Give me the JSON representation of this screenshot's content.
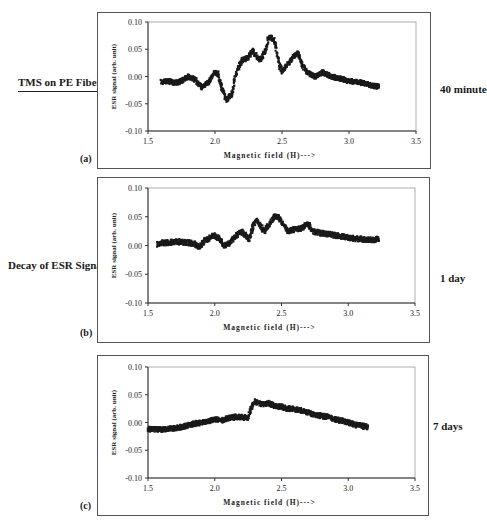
{
  "figure": {
    "left_title": "TMS on PE Fibers",
    "left_subtitle": "Decay of ESR Signal",
    "panels": [
      {
        "letter": "(a)",
        "time_label": "40 minutes"
      },
      {
        "letter": "(b)",
        "time_label": "1 day"
      },
      {
        "letter": "(c)",
        "time_label": "7 days"
      }
    ]
  },
  "chart_data": [
    {
      "type": "scatter",
      "panel": "(a)",
      "time_label": "40 minutes",
      "title": "",
      "xlabel": "Magnetic field (H)--->",
      "ylabel": "ESR signal (arb. unit)",
      "xlim": [
        1.5,
        3.5
      ],
      "ylim": [
        -0.1,
        0.1
      ],
      "xticks": [
        "1.5",
        "2.0",
        "2.5",
        "3.0",
        "3.5"
      ],
      "yticks": [
        "0.10",
        "0.05",
        "0.00",
        "-0.05",
        "-0.10"
      ],
      "grid": false,
      "marker_color": "#1a1a1a",
      "x": [
        1.6,
        1.65,
        1.7,
        1.75,
        1.8,
        1.85,
        1.9,
        1.95,
        2.0,
        2.02,
        2.05,
        2.08,
        2.1,
        2.13,
        2.15,
        2.18,
        2.2,
        2.25,
        2.28,
        2.3,
        2.33,
        2.35,
        2.38,
        2.4,
        2.43,
        2.45,
        2.48,
        2.5,
        2.52,
        2.55,
        2.6,
        2.62,
        2.65,
        2.7,
        2.75,
        2.8,
        2.85,
        2.9,
        2.95,
        3.0,
        3.05,
        3.1,
        3.15,
        3.2,
        3.23
      ],
      "y": [
        -0.01,
        -0.008,
        -0.012,
        -0.008,
        0.0,
        -0.005,
        -0.02,
        -0.01,
        0.008,
        0.005,
        -0.02,
        -0.042,
        -0.04,
        -0.03,
        0.0,
        0.02,
        0.03,
        0.035,
        0.048,
        0.04,
        0.03,
        0.035,
        0.05,
        0.072,
        0.07,
        0.06,
        0.02,
        0.01,
        0.015,
        0.025,
        0.04,
        0.042,
        0.02,
        0.005,
        0.0,
        0.008,
        0.002,
        -0.002,
        -0.005,
        -0.008,
        -0.01,
        -0.012,
        -0.015,
        -0.018,
        -0.018
      ]
    },
    {
      "type": "scatter",
      "panel": "(b)",
      "time_label": "1 day",
      "title": "",
      "xlabel": "Magnetic field (H)--->",
      "ylabel": "ESR signal (arb. unit)",
      "xlim": [
        1.5,
        3.5
      ],
      "ylim": [
        -0.1,
        0.1
      ],
      "xticks": [
        "1.5",
        "2.0",
        "2.5",
        "3.0",
        "3.5"
      ],
      "yticks": [
        "0.10",
        "0.05",
        "0.00",
        "-0.05",
        "-0.10"
      ],
      "grid": false,
      "marker_color": "#1a1a1a",
      "x": [
        1.57,
        1.6,
        1.65,
        1.7,
        1.75,
        1.8,
        1.85,
        1.88,
        1.92,
        1.95,
        2.0,
        2.03,
        2.07,
        2.1,
        2.15,
        2.2,
        2.23,
        2.26,
        2.28,
        2.31,
        2.34,
        2.37,
        2.4,
        2.45,
        2.48,
        2.52,
        2.55,
        2.6,
        2.65,
        2.7,
        2.73,
        2.78,
        2.85,
        2.9,
        2.95,
        3.0,
        3.05,
        3.1,
        3.15,
        3.2,
        3.23
      ],
      "y": [
        0.002,
        0.005,
        0.005,
        0.007,
        0.006,
        0.005,
        0.003,
        -0.003,
        0.008,
        0.012,
        0.018,
        0.012,
        0.0,
        0.002,
        0.015,
        0.024,
        0.018,
        0.01,
        0.03,
        0.045,
        0.035,
        0.025,
        0.035,
        0.05,
        0.048,
        0.035,
        0.025,
        0.028,
        0.03,
        0.038,
        0.025,
        0.022,
        0.02,
        0.018,
        0.016,
        0.014,
        0.012,
        0.011,
        0.01,
        0.01,
        0.012
      ]
    },
    {
      "type": "scatter",
      "panel": "(c)",
      "time_label": "7 days",
      "title": "",
      "xlabel": "Magnetic field (H)--->",
      "ylabel": "ESR signal (arb. unit)",
      "xlim": [
        1.5,
        3.5
      ],
      "ylim": [
        -0.1,
        0.1
      ],
      "xticks": [
        "1.5",
        "2.0",
        "2.5",
        "3.0",
        "3.5"
      ],
      "yticks": [
        "0.10",
        "0.05",
        "0.00",
        "-0.05",
        "-0.10"
      ],
      "grid": false,
      "marker_color": "#1a1a1a",
      "x": [
        1.5,
        1.55,
        1.6,
        1.65,
        1.7,
        1.75,
        1.8,
        1.85,
        1.9,
        1.95,
        2.0,
        2.05,
        2.1,
        2.15,
        2.2,
        2.25,
        2.27,
        2.3,
        2.35,
        2.4,
        2.45,
        2.5,
        2.55,
        2.6,
        2.65,
        2.7,
        2.75,
        2.8,
        2.85,
        2.9,
        2.95,
        3.0,
        3.05,
        3.1,
        3.15
      ],
      "y": [
        -0.012,
        -0.012,
        -0.013,
        -0.012,
        -0.01,
        -0.008,
        -0.005,
        -0.002,
        0.0,
        0.003,
        0.005,
        0.004,
        0.008,
        0.01,
        0.01,
        0.008,
        0.025,
        0.038,
        0.033,
        0.035,
        0.03,
        0.028,
        0.025,
        0.024,
        0.022,
        0.018,
        0.014,
        0.012,
        0.01,
        0.006,
        0.003,
        0.0,
        -0.004,
        -0.006,
        -0.008
      ]
    }
  ]
}
